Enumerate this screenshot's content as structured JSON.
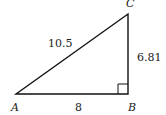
{
  "diagram": {
    "type": "right-triangle",
    "vertices": {
      "A": {
        "label": "A",
        "x": 16,
        "y": 94
      },
      "B": {
        "label": "B",
        "x": 128,
        "y": 94
      },
      "C": {
        "label": "C",
        "x": 128,
        "y": 14
      }
    },
    "sides": {
      "AC": {
        "label": "10.5"
      },
      "AB": {
        "label": "8"
      },
      "BC": {
        "label": "6.81"
      }
    },
    "right_angle_at": "B",
    "colors": {
      "stroke": "#111111",
      "text": "#222222"
    }
  }
}
